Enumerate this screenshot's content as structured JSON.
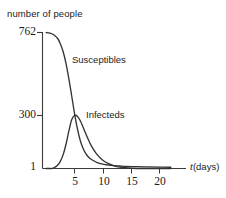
{
  "chart_data": {
    "type": "line",
    "title": "",
    "subtitle": "",
    "ylabel": "number of people",
    "xlabel_var": "t",
    "xlabel_unit": "(days)",
    "xlabel": "t (days)",
    "xlim": [
      0,
      22
    ],
    "ylim": [
      1,
      762
    ],
    "grid": false,
    "legend_position": "inline-annotations",
    "x_ticks": [
      {
        "value": 5,
        "label": "5"
      },
      {
        "value": 10,
        "label": "10"
      },
      {
        "value": 15,
        "label": "15"
      },
      {
        "value": 20,
        "label": "20"
      }
    ],
    "y_ticks": [
      {
        "value": 762,
        "label": "762"
      },
      {
        "value": 300,
        "label": "300"
      },
      {
        "value": 1,
        "label": "1"
      }
    ],
    "annotations": [
      {
        "name": "susceptibles-label",
        "text": "Susceptibles",
        "x": 7.5,
        "y": 620
      },
      {
        "name": "infecteds-label",
        "text": "Infecteds",
        "x": 10.0,
        "y": 300
      }
    ],
    "series": [
      {
        "name": "Susceptibles",
        "color": "#333333",
        "x": [
          0,
          0.5,
          1,
          1.5,
          2,
          2.5,
          3,
          3.5,
          4,
          4.5,
          5,
          5.5,
          6,
          6.5,
          7,
          7.5,
          8,
          9,
          10,
          11,
          12,
          13,
          14,
          16,
          18,
          20,
          22
        ],
        "values": [
          762,
          760,
          755,
          745,
          730,
          700,
          655,
          590,
          505,
          410,
          312,
          228,
          162,
          118,
          88,
          68,
          55,
          38,
          29,
          24,
          21,
          19,
          17,
          15,
          14,
          13,
          12
        ]
      },
      {
        "name": "Infecteds",
        "color": "#333333",
        "x": [
          0,
          0.5,
          1,
          1.5,
          2,
          2.5,
          3,
          3.5,
          4,
          4.5,
          5,
          5.5,
          6,
          6.5,
          7,
          7.5,
          8,
          9,
          10,
          11,
          12,
          13,
          14,
          16,
          18,
          20,
          22
        ],
        "values": [
          1,
          2,
          5,
          11,
          23,
          45,
          82,
          140,
          213,
          276,
          300,
          296,
          272,
          236,
          198,
          162,
          130,
          82,
          51,
          32,
          20,
          13,
          9,
          5,
          3,
          2,
          1
        ]
      }
    ]
  }
}
